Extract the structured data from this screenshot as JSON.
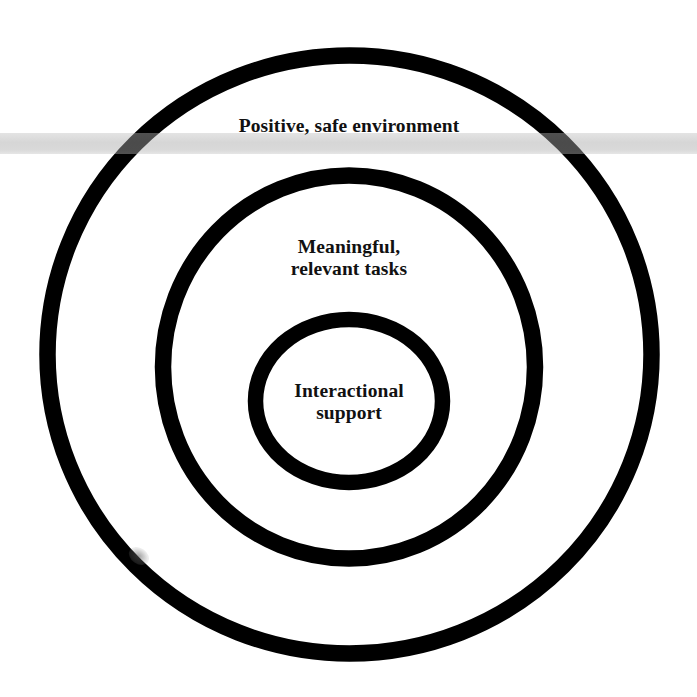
{
  "diagram": {
    "type": "concentric-circles",
    "colors": {
      "background": "#ffffff",
      "ring_stroke": "#000000",
      "band": "#d8d8d8",
      "text": "#111111"
    },
    "rings": [
      {
        "id": "outer",
        "label_lines": [
          "Positive, safe environment"
        ]
      },
      {
        "id": "middle",
        "label_lines": [
          "Meaningful,",
          "relevant tasks"
        ]
      },
      {
        "id": "inner",
        "label_lines": [
          "Interactional",
          "support"
        ]
      }
    ]
  }
}
